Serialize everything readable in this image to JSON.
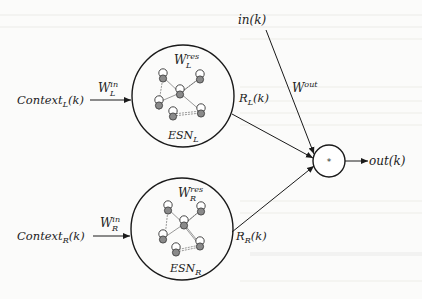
{
  "diagram": {
    "type": "dual-ESN architecture",
    "colors": {
      "stroke": "#1a1a1a",
      "node_fill": "#8a8a8a",
      "background": "#fbfbfa",
      "bleed_text": "#d8d8d4"
    },
    "inputs": {
      "left_context": {
        "base": "Context",
        "sub": "L",
        "arg": "(k)"
      },
      "right_context": {
        "base": "Context",
        "sub": "R",
        "arg": "(k)"
      },
      "direct_input": "in(k)"
    },
    "input_weights": {
      "left": {
        "base": "W",
        "sub": "L",
        "sup": "in"
      },
      "right": {
        "base": "W",
        "sub": "R",
        "sup": "in"
      }
    },
    "reservoirs": {
      "left": {
        "weight": {
          "base": "W",
          "sub": "L",
          "sup": "res"
        },
        "name": {
          "base": "ESN",
          "sub": "L"
        },
        "state": {
          "base": "R",
          "sub": "L",
          "arg": "(k)"
        }
      },
      "right": {
        "weight": {
          "base": "W",
          "sub": "R",
          "sup": "res"
        },
        "name": {
          "base": "ESN",
          "sub": "R"
        },
        "state": {
          "base": "R",
          "sub": "R",
          "arg": "(k)"
        }
      }
    },
    "output_weight": {
      "base": "W",
      "sup": "out"
    },
    "combiner": {
      "symbol": "*"
    },
    "output": "out(k)"
  }
}
